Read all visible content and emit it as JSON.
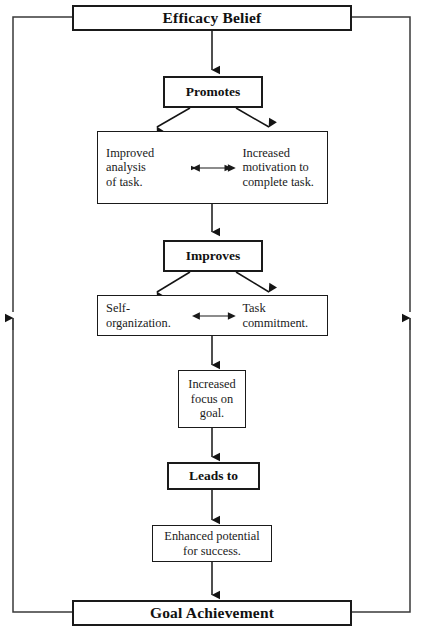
{
  "diagram": {
    "colors": {
      "line": "#1a1a1a",
      "text": "#111111",
      "background": "#ffffff"
    },
    "nodes": {
      "efficacy_belief": "Efficacy Belief",
      "promotes": "Promotes",
      "improved_analysis": "Improved\nanalysis\nof task.",
      "increased_motivation": "Increased\nmotivation to\ncomplete task.",
      "improves": "Improves",
      "self_organization": "Self-\norganization.",
      "task_commitment": "Task\ncommitment.",
      "increased_focus": "Increased\nfocus on\ngoal.",
      "leads_to": "Leads to",
      "enhanced_potential": "Enhanced potential\nfor success.",
      "goal_achievement": "Goal Achievement"
    }
  }
}
